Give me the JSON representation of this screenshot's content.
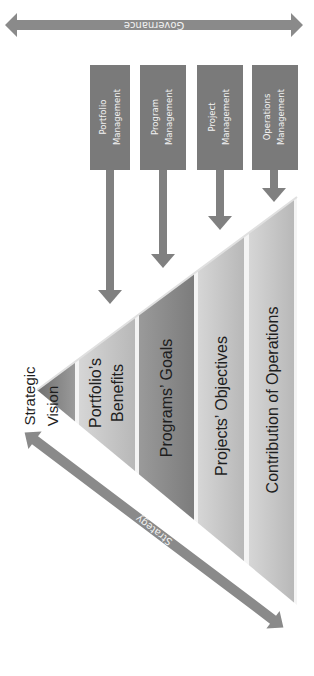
{
  "diagram": {
    "governance": {
      "label": "Governance"
    },
    "strategy": {
      "label": "Strategy"
    },
    "management_boxes": [
      {
        "line1": "Portfolio",
        "line2": "Management"
      },
      {
        "line1": "Program",
        "line2": "Management"
      },
      {
        "line1": "Project",
        "line2": "Management"
      },
      {
        "line1": "Operations",
        "line2": "Management"
      }
    ],
    "pyramid_layers": [
      {
        "line1": "Strategic",
        "line2": "Vision"
      },
      {
        "line1": "Portfolio’s",
        "line2": "Benefits"
      },
      {
        "line1": "Programs’ Goals",
        "line2": ""
      },
      {
        "line1": "Projects’ Objectives",
        "line2": ""
      },
      {
        "line1": "Contribution of Operations",
        "line2": ""
      }
    ],
    "colors": {
      "arrow": "#808080",
      "box": "#7a7a7a",
      "layer_light": "#c4c4c4",
      "layer_dark": "#8c8c8c",
      "text_dark": "#1e1e1e",
      "text_light": "#f2f2f2"
    }
  }
}
